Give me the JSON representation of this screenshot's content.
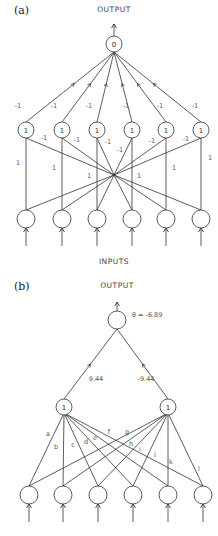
{
  "diagram_a": {
    "panel_label": "(a)",
    "output_caption": "OUTPUT",
    "inputs_caption": "INPUTS",
    "output_node": {
      "label": "0",
      "x": 114,
      "y": 44,
      "r": 8
    },
    "hidden_nodes": [
      {
        "label": "1",
        "x": 26,
        "y": 130
      },
      {
        "label": "1",
        "x": 62,
        "y": 130
      },
      {
        "label": "1",
        "x": 97,
        "y": 130
      },
      {
        "label": "1",
        "x": 132,
        "y": 130
      },
      {
        "label": "1",
        "x": 166,
        "y": 130
      },
      {
        "label": "1",
        "x": 201,
        "y": 130
      }
    ],
    "input_nodes": [
      {
        "x": 26,
        "y": 219
      },
      {
        "x": 62,
        "y": 219
      },
      {
        "x": 97,
        "y": 219
      },
      {
        "x": 132,
        "y": 219
      },
      {
        "x": 166,
        "y": 219
      },
      {
        "x": 201,
        "y": 219
      }
    ],
    "hidden_to_output_weights": [
      "-1",
      "-1",
      "-1",
      "-1",
      "-1",
      "-1"
    ],
    "cross_weight_label": "-1",
    "straight_weight_label": "1",
    "crossing_point": {
      "x": 114,
      "y": 175
    }
  },
  "diagram_b": {
    "panel_label": "(b)",
    "output_caption": "OUTPUT",
    "threshold_label": "θ = -6.89",
    "output_node": {
      "label": "",
      "x": 117,
      "y": 320,
      "r": 9
    },
    "hidden_nodes": [
      {
        "label": "1",
        "x": 64,
        "y": 407
      },
      {
        "label": "1",
        "x": 168,
        "y": 407
      }
    ],
    "input_nodes": [
      {
        "x": 29,
        "y": 495
      },
      {
        "x": 63,
        "y": 495
      },
      {
        "x": 98,
        "y": 495
      },
      {
        "x": 133,
        "y": 495
      },
      {
        "x": 168,
        "y": 495
      },
      {
        "x": 203,
        "y": 495
      }
    ],
    "hidden_to_output_weights": [
      "9.44",
      "-9.44"
    ],
    "input_weight_labels": [
      "a",
      "b",
      "c",
      "d",
      "e",
      "f",
      "g",
      "h",
      "i",
      "j",
      "k",
      "l"
    ]
  },
  "colors": {
    "line": "#333333",
    "node_fill": "#ffffff",
    "text": "#555555"
  }
}
